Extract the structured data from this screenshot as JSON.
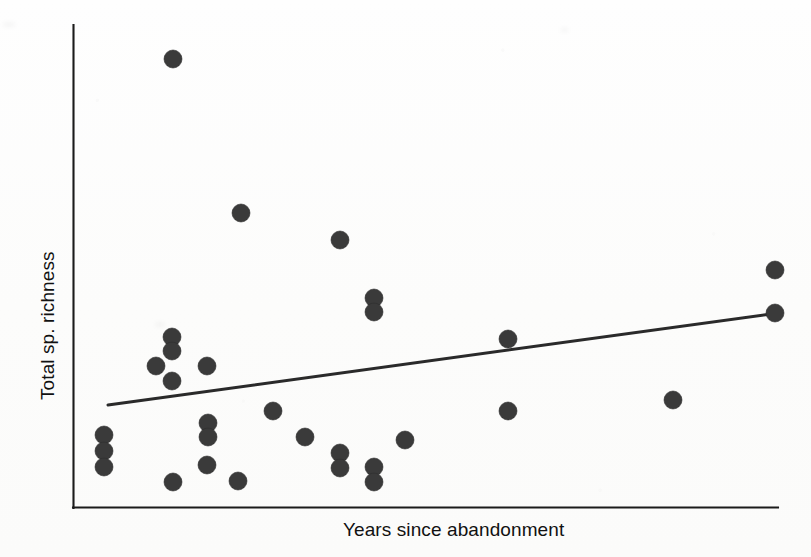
{
  "figure": {
    "background_color": "#fdfdfc",
    "ink_color": "#2e2e2e",
    "xlabel": "Years since abandonment",
    "ylabel": "Total sp. richness"
  },
  "axes": {
    "x_axis_name": "x-axis-line",
    "y_axis_name": "y-axis-line",
    "ticks_shown": "none",
    "tick_labels_shown": "none",
    "plot_left_px": 73,
    "plot_right_px": 778,
    "plot_top_px": 25,
    "plot_bottom_px": 508
  },
  "chart_data": {
    "type": "scatter",
    "title": "",
    "xlabel": "Years since abandonment",
    "ylabel": "Total sp. richness",
    "xlim": [
      0,
      1
    ],
    "ylim": [
      0,
      1
    ],
    "grid": false,
    "legend": "none",
    "tick_labels": {
      "x": [],
      "y": []
    },
    "marker": {
      "shape": "circle",
      "radius_px": 9,
      "color": "#3a3a3a"
    },
    "points_px": [
      {
        "x": 173,
        "y": 59
      },
      {
        "x": 241,
        "y": 213
      },
      {
        "x": 340,
        "y": 240
      },
      {
        "x": 775,
        "y": 270
      },
      {
        "x": 374,
        "y": 298
      },
      {
        "x": 374,
        "y": 312
      },
      {
        "x": 775,
        "y": 313
      },
      {
        "x": 172,
        "y": 337
      },
      {
        "x": 508,
        "y": 339
      },
      {
        "x": 172,
        "y": 351
      },
      {
        "x": 156,
        "y": 366
      },
      {
        "x": 207,
        "y": 366
      },
      {
        "x": 172,
        "y": 381
      },
      {
        "x": 673,
        "y": 400
      },
      {
        "x": 508,
        "y": 411
      },
      {
        "x": 273,
        "y": 411
      },
      {
        "x": 208,
        "y": 423
      },
      {
        "x": 104,
        "y": 435
      },
      {
        "x": 208,
        "y": 437
      },
      {
        "x": 305,
        "y": 437
      },
      {
        "x": 405,
        "y": 440
      },
      {
        "x": 104,
        "y": 451
      },
      {
        "x": 340,
        "y": 453
      },
      {
        "x": 207,
        "y": 465
      },
      {
        "x": 104,
        "y": 467
      },
      {
        "x": 374,
        "y": 467
      },
      {
        "x": 340,
        "y": 468
      },
      {
        "x": 374,
        "y": 482
      },
      {
        "x": 173,
        "y": 482
      },
      {
        "x": 238,
        "y": 481
      }
    ],
    "points_normalized": [
      {
        "x": 0.142,
        "y": 0.929
      },
      {
        "x": 0.238,
        "y": 0.611
      },
      {
        "x": 0.379,
        "y": 0.555
      },
      {
        "x": 0.997,
        "y": 0.493
      },
      {
        "x": 0.427,
        "y": 0.435
      },
      {
        "x": 0.427,
        "y": 0.406
      },
      {
        "x": 0.997,
        "y": 0.404
      },
      {
        "x": 0.14,
        "y": 0.354
      },
      {
        "x": 0.617,
        "y": 0.35
      },
      {
        "x": 0.14,
        "y": 0.325
      },
      {
        "x": 0.118,
        "y": 0.294
      },
      {
        "x": 0.19,
        "y": 0.294
      },
      {
        "x": 0.14,
        "y": 0.263
      },
      {
        "x": 0.851,
        "y": 0.224
      },
      {
        "x": 0.617,
        "y": 0.201
      },
      {
        "x": 0.284,
        "y": 0.201
      },
      {
        "x": 0.191,
        "y": 0.176
      },
      {
        "x": 0.044,
        "y": 0.151
      },
      {
        "x": 0.191,
        "y": 0.147
      },
      {
        "x": 0.329,
        "y": 0.147
      },
      {
        "x": 0.471,
        "y": 0.141
      },
      {
        "x": 0.044,
        "y": 0.118
      },
      {
        "x": 0.379,
        "y": 0.114
      },
      {
        "x": 0.19,
        "y": 0.089
      },
      {
        "x": 0.044,
        "y": 0.085
      },
      {
        "x": 0.427,
        "y": 0.085
      },
      {
        "x": 0.379,
        "y": 0.083
      },
      {
        "x": 0.427,
        "y": 0.054
      },
      {
        "x": 0.142,
        "y": 0.054
      },
      {
        "x": 0.234,
        "y": 0.056
      }
    ],
    "trendline": {
      "name": "linear regression fit",
      "style": "solid",
      "color": "#2a2a2a",
      "x0_px": 108,
      "y0_px": 405,
      "x1_px": 778,
      "y1_px": 313,
      "slope_sign": "positive"
    },
    "n_points": 30
  }
}
